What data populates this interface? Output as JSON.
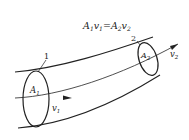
{
  "diagram": {
    "equation": {
      "A1": "A",
      "sub1": "1",
      "v1": "v",
      "subv1": "1",
      "eq": "=",
      "A2": "A",
      "sub2": "2",
      "v2": "v",
      "subv2": "2"
    },
    "section_labels": {
      "section1": "1",
      "section2": "2"
    },
    "area_labels": {
      "a1": "A",
      "a1_sub": "1",
      "a2": "A",
      "a2_sub": "2"
    },
    "velocity_labels": {
      "v1": "v",
      "v1_sub": "1",
      "v2": "v",
      "v2_sub": "2"
    },
    "colors": {
      "stroke": "#222222",
      "background": "#ffffff"
    }
  }
}
